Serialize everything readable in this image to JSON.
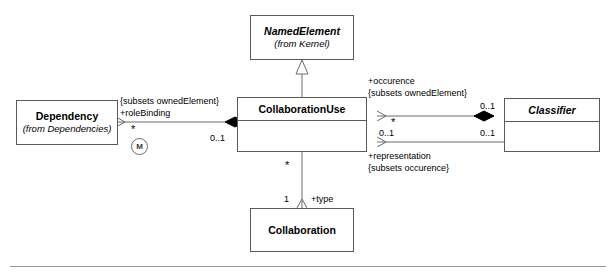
{
  "diagram": {
    "classes": [
      {
        "id": "named-element",
        "name": "NamedElement",
        "stereotype": "(from Kernel)",
        "abstract": true
      },
      {
        "id": "dependency",
        "name": "Dependency",
        "stereotype": "(from Dependencies)",
        "abstract": false
      },
      {
        "id": "collaboration-use",
        "name": "CollaborationUse",
        "stereotype": "",
        "abstract": false
      },
      {
        "id": "classifier",
        "name": "Classifier",
        "stereotype": "",
        "abstract": true
      },
      {
        "id": "collaboration",
        "name": "Collaboration",
        "stereotype": "",
        "abstract": false
      }
    ],
    "labels": {
      "role_binding_constraint": "{subsets ownedElement}",
      "role_binding_role": "+roleBinding",
      "role_binding_source_mult": "*",
      "role_binding_target_mult": "0..1",
      "role_binding_badge": "M",
      "occurence_role": "+occurence",
      "occurence_constraint": "{subsets ownedElement}",
      "occurence_source_mult": "*",
      "occurence_target_mult": "0..1",
      "representation_role": "+representation",
      "representation_constraint": "{subsets occurence}",
      "representation_left_mult": "0..1",
      "representation_right_mult": "0..1",
      "type_role": "+type",
      "type_source_mult": "*",
      "type_target_mult": "1"
    },
    "colors": {
      "stroke": "#5a5a5a",
      "line": "#6b6b6b",
      "fill": "#ffffff",
      "text": "#000000",
      "rule": "#9a9a9a"
    }
  }
}
